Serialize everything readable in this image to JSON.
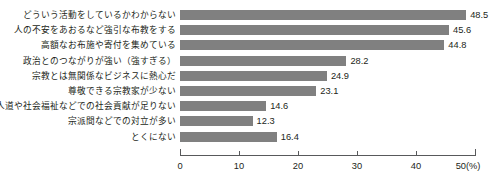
{
  "chart_data": {
    "type": "bar",
    "orientation": "horizontal",
    "title": "",
    "subtitle": "",
    "xlabel": "(%)",
    "ylabel": "",
    "categories": [
      "どういう活動をしているかわからない",
      "人の不安をあおるなど強引な布教をする",
      "高額なお布施や寄付を集めている",
      "政治とのつながりが強い（強すぎる）",
      "宗教とは無関係なビジネスに熱心だ",
      "尊敬できる宗教家が少ない",
      "人道や社会福祉などでの社会貢献が足りない",
      "宗派間などでの対立が多い",
      "とくにない"
    ],
    "values": [
      48.5,
      45.6,
      44.8,
      28.2,
      24.9,
      23.1,
      14.6,
      12.3,
      16.4
    ],
    "value_labels": [
      "48.5",
      "45.6",
      "44.8",
      "28.2",
      "24.9",
      "23.1",
      "14.6",
      "12.3",
      "16.4"
    ],
    "xlim": [
      0,
      50
    ],
    "xticks": [
      0,
      10,
      20,
      30,
      40,
      50
    ],
    "xtick_labels": [
      "0",
      "10",
      "20",
      "30",
      "40",
      "50"
    ],
    "xtick_unit_suffix": "(%)",
    "grid": false,
    "legend": false,
    "bar_color": "#808080",
    "axis_color": "#58595b",
    "text_color": "#231f20",
    "background": "#ffffff"
  }
}
